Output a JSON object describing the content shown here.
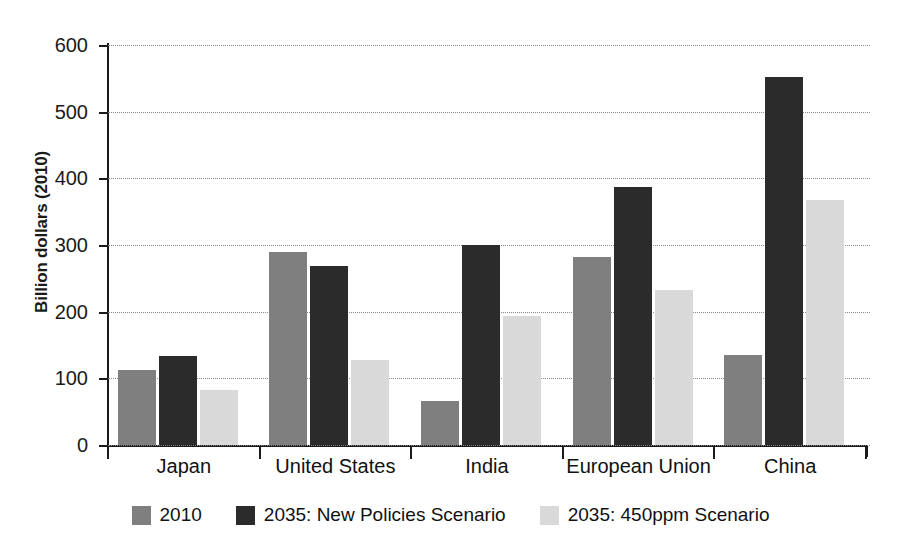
{
  "chart_data": {
    "type": "bar",
    "title": "",
    "subtitle": "",
    "xlabel": "",
    "ylabel": "Billion dollars (2010)",
    "ylim": [
      0,
      600
    ],
    "yticks": [
      0,
      100,
      200,
      300,
      400,
      500,
      600
    ],
    "ytick_labels": [
      "0",
      "100",
      "200",
      "300",
      "400",
      "500",
      "600"
    ],
    "grid": true,
    "legend_position": "bottom-center",
    "categories": [
      "Japan",
      "United States",
      "India",
      "European Union",
      "China"
    ],
    "series": [
      {
        "name": "2010",
        "color": "#7f7f7f",
        "values": [
          112,
          289,
          66,
          282,
          135
        ]
      },
      {
        "name": "2035: New Policies Scenario",
        "color": "#2b2b2b",
        "values": [
          134,
          269,
          300,
          387,
          552
        ]
      },
      {
        "name": "2035: 450ppm Scenario",
        "color": "#d9d9d9",
        "values": [
          82,
          128,
          194,
          232,
          367
        ]
      }
    ]
  },
  "legend": {
    "items": [
      {
        "label": "2010",
        "swatch": "legend-swatch-2010"
      },
      {
        "label": "2035: New Policies Scenario",
        "swatch": "legend-swatch-new-policies"
      },
      {
        "label": "2035: 450ppm Scenario",
        "swatch": "legend-swatch-450ppm"
      }
    ]
  },
  "colors": {
    "series_2010": "#7f7f7f",
    "series_new_policies": "#2b2b2b",
    "series_450ppm": "#d9d9d9",
    "axis": "#1a1a1a",
    "gridline": "#8a8a8a",
    "background": "#ffffff"
  }
}
